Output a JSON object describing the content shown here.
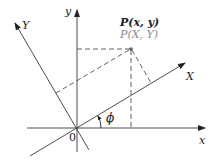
{
  "figure": {
    "labels": {
      "x_axis": "x",
      "y_axis": "y",
      "X_axis": "X",
      "Y_axis": "Y",
      "origin": "0",
      "angle": "ϕ",
      "point_xy": "P(x, y)",
      "point_XY": "P(X, Y)"
    },
    "colors": {
      "line": "#3a3a3a",
      "text": "#222222",
      "secondary_text": "#8a8a8a"
    },
    "rotation_angle_deg": 30
  }
}
